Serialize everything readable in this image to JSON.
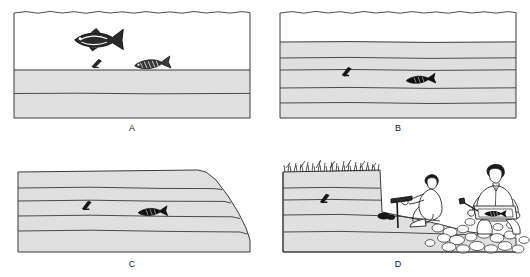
{
  "figure": {
    "panel_count": 4,
    "background_color": "#ffffff",
    "rock_fill_color": "#e0e0e0",
    "water_fill_color": "#ffffff",
    "line_color": "#3a3a3a",
    "fossil_color": "#1a1a1a"
  },
  "panels": [
    {
      "id": "A",
      "label": "A",
      "caption_position": "bottom-center",
      "scene": "living-fish-and-remains-on-seafloor",
      "water_label": "water",
      "sediment_layers": 2,
      "objects": [
        {
          "name": "swimming-fish",
          "state": "alive"
        },
        {
          "name": "fish-skeleton-on-seafloor",
          "state": "dead-remains"
        },
        {
          "name": "bone-fragment-on-seafloor",
          "state": "dead-remains"
        }
      ]
    },
    {
      "id": "B",
      "label": "B",
      "caption_position": "bottom-center",
      "scene": "remains-buried-by-sediment-layers",
      "water_label": "water",
      "sediment_layers": 5,
      "objects": [
        {
          "name": "buried-fossil-fish",
          "state": "fossilized"
        },
        {
          "name": "buried-fossil-fragment",
          "state": "fossilized"
        }
      ]
    },
    {
      "id": "C",
      "label": "C",
      "caption_position": "bottom-center",
      "scene": "uplifted-and-eroded-rock-layers",
      "sediment_layers": 5,
      "objects": [
        {
          "name": "buried-fossil-fish",
          "state": "fossilized"
        },
        {
          "name": "buried-fossil-fragment",
          "state": "fossilized"
        }
      ]
    },
    {
      "id": "D",
      "label": "D",
      "caption_position": "bottom-center",
      "scene": "paleontologists-collecting-fossils-at-outcrop",
      "sediment_layers": 5,
      "objects": [
        {
          "name": "grass-on-cliff-top",
          "state": "vegetation"
        },
        {
          "name": "exposed-fossil-in-cliff",
          "state": "fossilized"
        },
        {
          "name": "kneeling-worker-with-rock-hammer",
          "state": "digging"
        },
        {
          "name": "kneeling-worker-holding-fossil-slab",
          "state": "holding-specimen"
        },
        {
          "name": "rock-rubble-talus",
          "state": "debris"
        }
      ]
    }
  ]
}
